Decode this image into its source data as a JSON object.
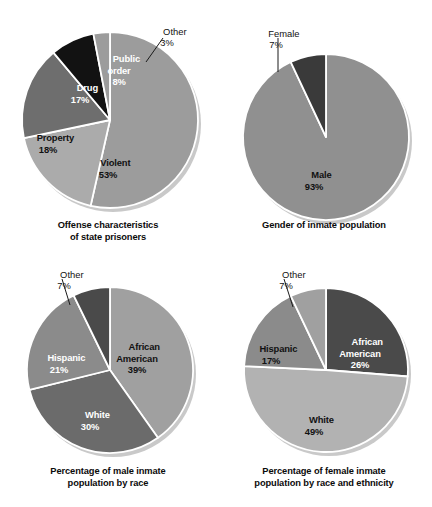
{
  "figure": {
    "background": "#ffffff",
    "style": "grayscale-pie-chart-set",
    "panel_count": 4
  },
  "chart_data": [
    {
      "type": "pie",
      "id": "offense-characteristics",
      "title": "Offense characteristics\nof state prisoners",
      "title_line1": "Offense characteristics",
      "title_line2": "of state prisoners",
      "legend": "none",
      "start_angle_deg": 0,
      "direction": "clockwise",
      "categories": [
        "Violent",
        "Property",
        "Drug",
        "Public order",
        "Other"
      ],
      "values": [
        53,
        18,
        17,
        8,
        3
      ],
      "unit": "%",
      "slices": [
        {
          "label": "Violent",
          "value": 53,
          "display": "53%",
          "color": "#9c9c9c",
          "label_line1": "Violent",
          "label_line2": "53%",
          "label_color": "#111111",
          "callout": false
        },
        {
          "label": "Property",
          "value": 18,
          "display": "18%",
          "color": "#ababab",
          "label_line1": "Property",
          "label_line2": "18%",
          "label_color": "#111111",
          "callout": false
        },
        {
          "label": "Drug",
          "value": 17,
          "display": "17%",
          "color": "#6e6e6e",
          "label_line1": "Drug",
          "label_line2": "17%",
          "label_color": "#ffffff",
          "callout": false
        },
        {
          "label": "Public order",
          "value": 8,
          "display": "8%",
          "color": "#121212",
          "label_line1": "Public",
          "label_line2": "order",
          "label_line3": "8%",
          "label_color": "#ffffff",
          "callout": false
        },
        {
          "label": "Other",
          "value": 3,
          "display": "3%",
          "color": "#9c9c9c",
          "label_line1": "Other",
          "label_line2": "3%",
          "label_color": "#111111",
          "callout": true
        }
      ]
    },
    {
      "type": "pie",
      "id": "gender-of-inmate-population",
      "title": "Gender of inmate population",
      "title_line1": "Gender of inmate population",
      "title_line2": "",
      "legend": "none",
      "start_angle_deg": 0,
      "direction": "clockwise",
      "categories": [
        "Male",
        "Female"
      ],
      "values": [
        93,
        7
      ],
      "unit": "%",
      "slices": [
        {
          "label": "Male",
          "value": 93,
          "display": "93%",
          "color": "#909090",
          "label_line1": "Male",
          "label_line2": "93%",
          "label_color": "#111111",
          "callout": false
        },
        {
          "label": "Female",
          "value": 7,
          "display": "7%",
          "color": "#3a3a3a",
          "label_line1": "Female",
          "label_line2": "7%",
          "label_color": "#111111",
          "callout": true
        }
      ]
    },
    {
      "type": "pie",
      "id": "male-inmate-population-by-race",
      "title": "Percentage of male inmate\npopulation by race",
      "title_line1": "Percentage of male inmate",
      "title_line2": "population by race",
      "legend": "none",
      "start_angle_deg": 0,
      "direction": "clockwise",
      "categories": [
        "African American",
        "White",
        "Hispanic",
        "Other"
      ],
      "values": [
        39,
        30,
        21,
        7
      ],
      "unit": "%",
      "slices": [
        {
          "label": "African American",
          "value": 39,
          "display": "39%",
          "color": "#a0a0a0",
          "label_line1": "African",
          "label_line2": "American",
          "label_line3": "39%",
          "label_color": "#111111",
          "callout": false
        },
        {
          "label": "White",
          "value": 30,
          "display": "30%",
          "color": "#6b6b6b",
          "label_line1": "White",
          "label_line2": "30%",
          "label_color": "#ffffff",
          "callout": false
        },
        {
          "label": "Hispanic",
          "value": 21,
          "display": "21%",
          "color": "#8b8b8b",
          "label_line1": "Hispanic",
          "label_line2": "21%",
          "label_color": "#ffffff",
          "callout": false
        },
        {
          "label": "Other",
          "value": 7,
          "display": "7%",
          "color": "#4a4a4a",
          "label_line1": "Other",
          "label_line2": "7%",
          "label_color": "#111111",
          "callout": true
        }
      ]
    },
    {
      "type": "pie",
      "id": "female-inmate-population-by-race-and-ethnicity",
      "title": "Percentage of female inmate\npopulation by race and ethnicity",
      "title_line1": "Percentage of female inmate",
      "title_line2": "population by race and ethnicity",
      "legend": "none",
      "start_angle_deg": 0,
      "direction": "clockwise",
      "categories": [
        "African American",
        "White",
        "Hispanic",
        "Other"
      ],
      "values": [
        26,
        49,
        17,
        7
      ],
      "unit": "%",
      "slices": [
        {
          "label": "African American",
          "value": 26,
          "display": "26%",
          "color": "#4a4a4a",
          "label_line1": "African",
          "label_line2": "American",
          "label_line3": "26%",
          "label_color": "#ffffff",
          "callout": false
        },
        {
          "label": "White",
          "value": 49,
          "display": "49%",
          "color": "#b2b2b2",
          "label_line1": "White",
          "label_line2": "49%",
          "label_color": "#111111",
          "callout": false
        },
        {
          "label": "Hispanic",
          "value": 17,
          "display": "17%",
          "color": "#8b8b8b",
          "label_line1": "Hispanic",
          "label_line2": "17%",
          "label_color": "#111111",
          "callout": false
        },
        {
          "label": "Other",
          "value": 7,
          "display": "7%",
          "color": "#a0a0a0",
          "label_line1": "Other",
          "label_line2": "7%",
          "label_color": "#111111",
          "callout": true
        }
      ]
    }
  ],
  "panels": [
    {
      "caption_line1": "Offense characteristics",
      "caption_line2": "of state prisoners",
      "labels": [
        {
          "name": "violent",
          "line1": "Violent",
          "line2": "53%",
          "x": 108,
          "y": 152,
          "tone": "dark"
        },
        {
          "name": "property",
          "line1": "Property",
          "line2": "18%",
          "x": 48,
          "y": 126,
          "tone": "dark"
        },
        {
          "name": "drug",
          "line1": "Drug",
          "line2": "17%",
          "x": 80,
          "y": 76,
          "tone": "light"
        },
        {
          "name": "public-order",
          "line1": "Public",
          "line2": "order",
          "line3": "8%",
          "x": 118,
          "y": 50,
          "tone": "light"
        }
      ],
      "callouts": [
        {
          "name": "other",
          "line1": "Other",
          "line2": "3%",
          "x": 165,
          "y": 20
        }
      ]
    },
    {
      "caption_line1": "Gender of inmate population",
      "caption_line2": "",
      "labels": [
        {
          "name": "male",
          "line1": "Male",
          "line2": "93%",
          "x": 98,
          "y": 164,
          "tone": "dark"
        }
      ],
      "callouts": [
        {
          "name": "female",
          "line1": "Female",
          "line2": "7%",
          "x": 60,
          "y": 22
        }
      ]
    },
    {
      "caption_line1": "Percentage of male inmate",
      "caption_line2": "population by race",
      "labels": [
        {
          "name": "african-american",
          "line1": "African",
          "line2": "American",
          "line3": "39%",
          "x": 133,
          "y": 88,
          "tone": "dark"
        },
        {
          "name": "white",
          "line1": "White",
          "line2": "30%",
          "x": 90,
          "y": 150,
          "tone": "light"
        },
        {
          "name": "hispanic",
          "line1": "Hispanic",
          "line2": "21%",
          "x": 60,
          "y": 93,
          "tone": "light"
        }
      ],
      "callouts": [
        {
          "name": "other",
          "line1": "Other",
          "line2": "7%",
          "x": 63,
          "y": 10
        }
      ]
    },
    {
      "caption_line1": "Percentage of female inmate",
      "caption_line2": "population by race and ethnicity",
      "labels": [
        {
          "name": "african-american",
          "line1": "African",
          "line2": "American",
          "line3": "26%",
          "x": 140,
          "y": 82,
          "tone": "light"
        },
        {
          "name": "white",
          "line1": "White",
          "line2": "49%",
          "x": 98,
          "y": 155,
          "tone": "dark"
        },
        {
          "name": "hispanic",
          "line1": "Hispanic",
          "line2": "17%",
          "x": 55,
          "y": 84,
          "tone": "dark"
        }
      ],
      "callouts": [
        {
          "name": "other",
          "line1": "Other",
          "line2": "7%",
          "x": 70,
          "y": 10
        }
      ]
    }
  ]
}
